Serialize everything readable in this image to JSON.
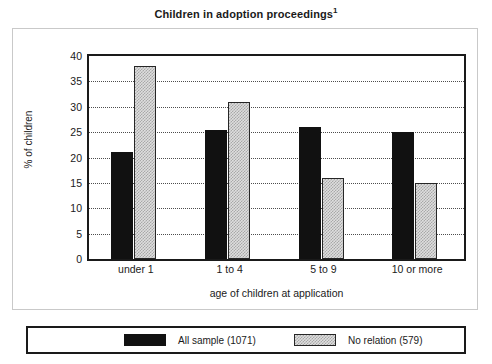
{
  "chart_data": {
    "type": "bar",
    "title": "Children in adoption proceedings",
    "title_footnote_marker": "1",
    "xlabel": "age of children at application",
    "ylabel": "% of children",
    "categories": [
      "under 1",
      "1 to 4",
      "5 to 9",
      "10 or more"
    ],
    "series": [
      {
        "name": "All sample (1071)",
        "values": [
          21,
          25.5,
          26,
          25
        ],
        "color": "#111111",
        "pattern": "solid"
      },
      {
        "name": "No relation (579)",
        "values": [
          38,
          31,
          16,
          15
        ],
        "color": "#dedede",
        "pattern": "dotted-fill"
      }
    ],
    "ylim": [
      0,
      40
    ],
    "yticks": [
      0,
      5,
      10,
      15,
      20,
      25,
      30,
      35,
      40
    ],
    "ytick_labels": [
      "0",
      "5",
      "10",
      "15",
      "20",
      "25",
      "30",
      "35",
      "40"
    ],
    "grid": true,
    "grid_style": "dotted-horizontal",
    "legend_position": "bottom"
  }
}
